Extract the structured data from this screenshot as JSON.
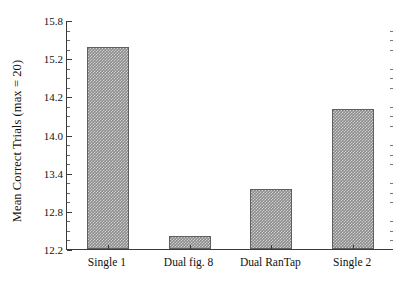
{
  "chart_data": {
    "type": "bar",
    "title": "",
    "xlabel": "",
    "ylabel": "Mean Correct Trials (max = 20)",
    "categories": [
      "Single 1",
      "Dual fig. 8",
      "Dual RanTap",
      "Single 2"
    ],
    "values": [
      15.37,
      12.4,
      13.14,
      14.4
    ],
    "ylim": [
      12.2,
      15.8
    ],
    "ytick_labels": [
      "15.8",
      "15.2",
      "14.2",
      "14.0",
      "13.4",
      "12.8",
      "12.2"
    ],
    "ytick_values": [
      15.8,
      15.2,
      14.6,
      14.0,
      13.4,
      12.8,
      12.2
    ],
    "minor_ticks_per_interval": 3,
    "grid": false,
    "legend": "none",
    "bar_color": "#8a8a8a",
    "bar_edge_color": "#5f5f5f",
    "axis_color": "#3a3a3a",
    "background_color": "#ffffff"
  }
}
